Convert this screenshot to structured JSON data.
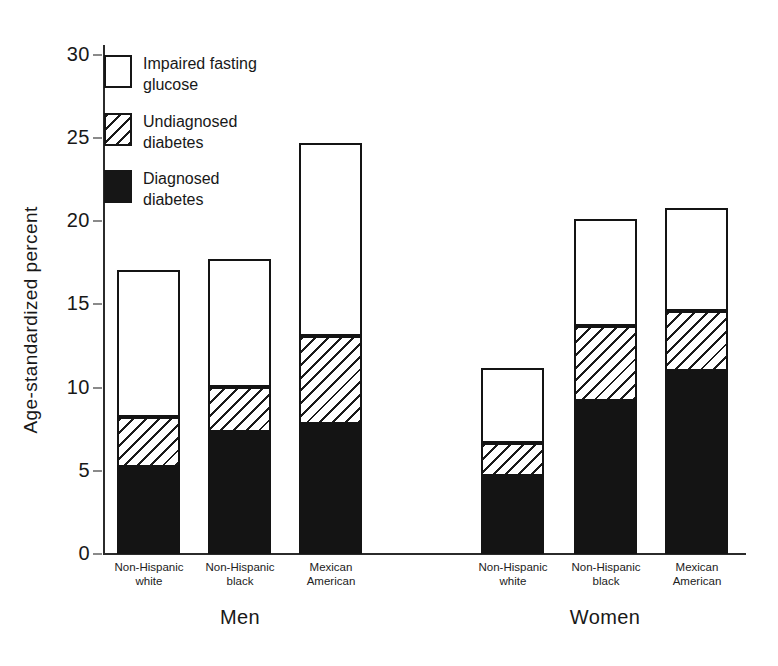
{
  "figure": {
    "background": "#ffffff",
    "ink": "#1a1a1a"
  },
  "y_axis": {
    "title": "Age-standardized percent",
    "tick_labels": [
      "0",
      "5",
      "10",
      "15",
      "20",
      "25",
      "30"
    ]
  },
  "x_axis": {
    "group_labels": [
      "Men",
      "Women"
    ],
    "category_labels": [
      "Non-Hispanic white",
      "Non-Hispanic black",
      "Mexican American"
    ]
  },
  "legend": {
    "items": [
      {
        "label": "Impaired fasting glucose",
        "lines": [
          "Impaired fasting",
          "glucose"
        ],
        "swatch": "white"
      },
      {
        "label": "Undiagnosed diabetes",
        "lines": [
          "Undiagnosed",
          "diabetes"
        ],
        "swatch": "hatch"
      },
      {
        "label": "Diagnosed diabetes",
        "lines": [
          "Diagnosed",
          "diabetes"
        ],
        "swatch": "black"
      }
    ]
  },
  "chart_data": {
    "type": "bar",
    "stacked": true,
    "title": "",
    "ylabel": "Age-standardized percent",
    "xlabel": "",
    "ylim": [
      0,
      30
    ],
    "yticks": [
      0,
      5,
      10,
      15,
      20,
      25,
      30
    ],
    "grid": false,
    "legend_position": "top-left",
    "segments_bottom_to_top": [
      "diagnosed_diabetes",
      "undiagnosed_diabetes",
      "impaired_fasting_glucose"
    ],
    "segment_labels": {
      "diagnosed_diabetes": "Diagnosed diabetes",
      "undiagnosed_diabetes": "Undiagnosed diabetes",
      "impaired_fasting_glucose": "Impaired fasting glucose"
    },
    "groups": [
      {
        "label": "Men",
        "bars": [
          {
            "category": "Non-Hispanic white",
            "diagnosed_diabetes": 5.2,
            "undiagnosed_diabetes": 3.0,
            "impaired_fasting_glucose": 8.8,
            "total": 17.0
          },
          {
            "category": "Non-Hispanic black",
            "diagnosed_diabetes": 7.3,
            "undiagnosed_diabetes": 2.7,
            "impaired_fasting_glucose": 7.7,
            "total": 17.7
          },
          {
            "category": "Mexican American",
            "diagnosed_diabetes": 7.8,
            "undiagnosed_diabetes": 5.3,
            "impaired_fasting_glucose": 11.6,
            "total": 24.7
          }
        ]
      },
      {
        "label": "Women",
        "bars": [
          {
            "category": "Non-Hispanic white",
            "diagnosed_diabetes": 4.7,
            "undiagnosed_diabetes": 2.0,
            "impaired_fasting_glucose": 4.5,
            "total": 11.2
          },
          {
            "category": "Non-Hispanic black",
            "diagnosed_diabetes": 9.2,
            "undiagnosed_diabetes": 4.5,
            "impaired_fasting_glucose": 6.4,
            "total": 20.1
          },
          {
            "category": "Mexican American",
            "diagnosed_diabetes": 11.0,
            "undiagnosed_diabetes": 3.6,
            "impaired_fasting_glucose": 6.2,
            "total": 20.8
          }
        ]
      }
    ]
  }
}
